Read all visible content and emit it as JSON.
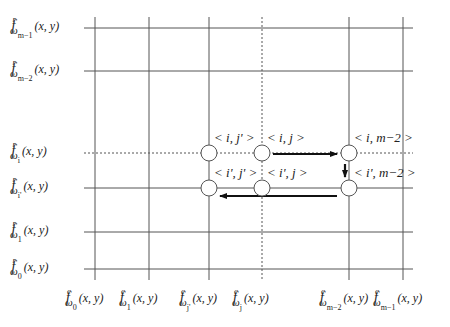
{
  "diagram": {
    "type": "grid-path",
    "row_labels": [
      {
        "f": "f",
        "sup": "r",
        "sub": "ω",
        "subsub": "m−1",
        "args": "(x, y)",
        "y": 28,
        "style": "solid"
      },
      {
        "f": "f",
        "sup": "r",
        "sub": "ω",
        "subsub": "m−2",
        "args": "(x, y)",
        "y": 71,
        "style": "solid"
      },
      {
        "f": "f",
        "sup": "r",
        "sub": "ω",
        "subsub": "i",
        "args": "(x, y)",
        "y": 153,
        "style": "dashed"
      },
      {
        "f": "f",
        "sup": "r",
        "sub": "ω",
        "subsub": "i'",
        "args": "(x, y)",
        "y": 188,
        "style": "solid"
      },
      {
        "f": "f",
        "sup": "r",
        "sub": "ω",
        "subsub": "1",
        "args": "(x, y)",
        "y": 232,
        "style": "solid"
      },
      {
        "f": "f",
        "sup": "r",
        "sub": "ω",
        "subsub": "0",
        "args": "(x, y)",
        "y": 269,
        "style": "solid"
      }
    ],
    "col_labels": [
      {
        "f": "f",
        "sup": "c",
        "sub": "ω",
        "subsub": "0",
        "args": "(x, y)",
        "x": 95,
        "style": "solid"
      },
      {
        "f": "f",
        "sup": "c",
        "sub": "ω",
        "subsub": "1",
        "args": "(x, y)",
        "x": 149,
        "style": "solid"
      },
      {
        "f": "f",
        "sup": "c",
        "sub": "ω",
        "subsub": "j'",
        "args": "(x, y)",
        "x": 209,
        "style": "solid"
      },
      {
        "f": "f",
        "sup": "c",
        "sub": "ω",
        "subsub": "j",
        "args": "(x, y)",
        "x": 262,
        "style": "dashed"
      },
      {
        "f": "f",
        "sup": "c",
        "sub": "ω",
        "subsub": "m−2",
        "args": "(x, y)",
        "x": 349,
        "style": "solid"
      },
      {
        "f": "f",
        "sup": "c",
        "sub": "ω",
        "subsub": "m−1",
        "args": "(x, y)",
        "x": 403,
        "style": "solid"
      }
    ],
    "nodes": [
      {
        "id": "n1",
        "label": "< i, j' >",
        "x": 209,
        "y": 153
      },
      {
        "id": "n2",
        "label": "< i, j >",
        "x": 262,
        "y": 153
      },
      {
        "id": "n3",
        "label": "< i, m−2 >",
        "x": 349,
        "y": 153
      },
      {
        "id": "n4",
        "label": "< i', m−2 >",
        "x": 349,
        "y": 188
      },
      {
        "id": "n5",
        "label": "< i', j >",
        "x": 262,
        "y": 188
      },
      {
        "id": "n6",
        "label": "< i', j' >",
        "x": 209,
        "y": 188
      }
    ],
    "arrows": [
      {
        "from": "n2",
        "to": "n3",
        "direction": "right"
      },
      {
        "from": "n3",
        "to": "n4",
        "direction": "down"
      },
      {
        "from": "n4",
        "to": "n6",
        "direction": "left"
      }
    ],
    "colors": {
      "line": "#555555",
      "arrow": "#111111",
      "node_fill": "#ffffff",
      "node_stroke": "#555555"
    }
  }
}
